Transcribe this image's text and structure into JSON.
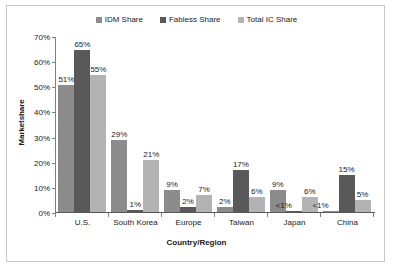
{
  "chart_data": {
    "type": "bar",
    "title": "",
    "xlabel": "Country/Region",
    "ylabel": "Marketshare",
    "categories": [
      "U.S.",
      "South Korea",
      "Europe",
      "Taiwan",
      "Japan",
      "China"
    ],
    "series": [
      {
        "name": "IDM Share",
        "color": "#8c8c8c",
        "values": [
          51,
          29,
          9,
          2,
          9,
          0.5
        ],
        "labels": [
          "51%",
          "29%",
          "9%",
          "2%",
          "9%",
          "<1%"
        ]
      },
      {
        "name": "Fabless Share",
        "color": "#595959",
        "values": [
          65,
          1,
          2,
          17,
          0.5,
          15
        ],
        "labels": [
          "65%",
          "1%",
          "2%",
          "17%",
          "<1%",
          "15%"
        ]
      },
      {
        "name": "Total IC Share",
        "color": "#b3b3b3",
        "values": [
          55,
          21,
          7,
          6,
          6,
          5
        ],
        "labels": [
          "55%",
          "21%",
          "7%",
          "6%",
          "6%",
          "5%"
        ]
      }
    ],
    "ylim": [
      0,
      70
    ],
    "ytick_labels": [
      "0%",
      "10%",
      "20%",
      "30%",
      "40%",
      "50%",
      "60%",
      "70%"
    ],
    "ytick_values": [
      0,
      10,
      20,
      30,
      40,
      50,
      60,
      70
    ],
    "grid": false,
    "legend_position": "top-center"
  }
}
